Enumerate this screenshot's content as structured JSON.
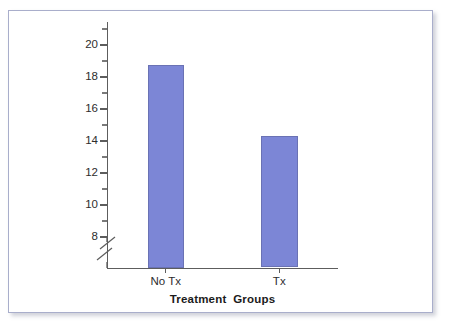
{
  "figure": {
    "frame_border_color": "#a9aecb",
    "background_color": "#ffffff",
    "axis_color": "#5d5d5d",
    "bar_fill_color": "#7c86d6",
    "bar_edge_color": "#6a72b4"
  },
  "chart_data": {
    "type": "bar",
    "title": "",
    "subtitle": "",
    "xlabel": "Treatment  Groups",
    "ylabel": "",
    "categories": [
      "No Tx",
      "Tx"
    ],
    "values": [
      18.75,
      14.3
    ],
    "series": [
      {
        "name": "",
        "values": [
          18.75,
          14.3
        ]
      }
    ],
    "ylim": [
      7.2,
      21.0
    ],
    "ytick_labels": [
      "20",
      "18",
      "16",
      "14",
      "12",
      "10",
      "8"
    ],
    "ytick_values": [
      20,
      18,
      16,
      14,
      12,
      10,
      8
    ],
    "yminor_tick_values": [
      21,
      19,
      17,
      15,
      13,
      11,
      9
    ],
    "axis_break": true,
    "axis_break_note": "broken y-axis below 8",
    "grid": false,
    "legend": false,
    "legend_position": "none",
    "annotations": []
  }
}
